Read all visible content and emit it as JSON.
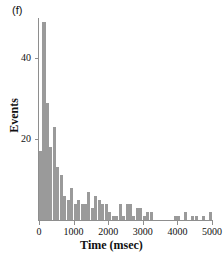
{
  "figure": {
    "panel_label": "(f)",
    "bar_color": "#9a9a9a",
    "axis_color": "#8e8e8e",
    "text_color": "#111111",
    "background": "#ffffff"
  },
  "chart_data": {
    "type": "bar",
    "title": "",
    "subtitle": "",
    "xlabel": "Time (msec)",
    "ylabel": "Events",
    "annotations": [
      "(f)"
    ],
    "legend": [],
    "legend_position": "none",
    "grid": false,
    "bin_width": 100,
    "xlim": [
      0,
      5100
    ],
    "ylim": [
      0,
      52
    ],
    "xticks": [
      0,
      1000,
      2000,
      3000,
      4000,
      5000
    ],
    "xtick_labels": [
      "0",
      "1000",
      "2000",
      "3000",
      "4000",
      "5000"
    ],
    "yticks": [
      20,
      40
    ],
    "ytick_labels": [
      "20",
      "40"
    ],
    "x": [
      100,
      200,
      300,
      400,
      500,
      600,
      700,
      800,
      900,
      1000,
      1100,
      1200,
      1300,
      1400,
      1500,
      1600,
      1700,
      1800,
      1900,
      2000,
      2100,
      2200,
      2300,
      2400,
      2500,
      2600,
      2700,
      2800,
      2900,
      3000,
      3100,
      3200,
      3300,
      3400,
      3500,
      3600,
      3700,
      3800,
      3900,
      4000,
      4100,
      4200,
      4300,
      4400,
      4500,
      4600,
      4700,
      4800,
      4900,
      5000
    ],
    "values": [
      17,
      49,
      29,
      18,
      23,
      13,
      11,
      6,
      5,
      8,
      4,
      5,
      4,
      4,
      7,
      3,
      6,
      5,
      4,
      4,
      2,
      1,
      1,
      4,
      1,
      4,
      4,
      1,
      3,
      3,
      1,
      2,
      2,
      0,
      0,
      0,
      0,
      0,
      0,
      1,
      1,
      0,
      2,
      0,
      1,
      1,
      0,
      1,
      0,
      2
    ],
    "categories": [
      "100",
      "200",
      "300",
      "400",
      "500",
      "600",
      "700",
      "800",
      "900",
      "1000",
      "1100",
      "1200",
      "1300",
      "1400",
      "1500",
      "1600",
      "1700",
      "1800",
      "1900",
      "2000",
      "2100",
      "2200",
      "2300",
      "2400",
      "2500",
      "2600",
      "2700",
      "2800",
      "2900",
      "3000",
      "3100",
      "3200",
      "3300",
      "3400",
      "3500",
      "3600",
      "3700",
      "3800",
      "3900",
      "4000",
      "4100",
      "4200",
      "4300",
      "4400",
      "4500",
      "4600",
      "4700",
      "4800",
      "4900",
      "5000"
    ]
  }
}
